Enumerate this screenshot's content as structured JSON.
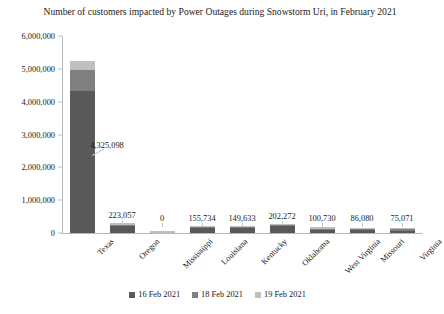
{
  "chart_data": {
    "type": "bar",
    "subtype": "stacked-column",
    "title": "Number of customers impacted by Power Outages during Snowstorm Uri, in February 2021",
    "xlabel": "",
    "ylabel": "",
    "ylim": [
      0,
      6000000
    ],
    "ytick_labels": [
      "6,000,000",
      "5,000,000",
      "4,000,000",
      "3,000,000",
      "2,000,000",
      "1,000,000",
      "0"
    ],
    "ytick_values": [
      6000000,
      5000000,
      4000000,
      3000000,
      2000000,
      1000000,
      0
    ],
    "grid": false,
    "legend_position": "bottom",
    "categories": [
      "Texas",
      "Oregon",
      "Mississippi",
      "Louisiana",
      "Kentucky",
      "Oklahoma",
      "West Virginia",
      "Missouri",
      "Virginia"
    ],
    "series": [
      {
        "name": "16 Feb 2021",
        "color": "#595959",
        "values": [
          4325098,
          223057,
          0,
          155734,
          149633,
          202272,
          100730,
          86080,
          75071
        ]
      },
      {
        "name": "18 Feb 2021",
        "color": "#808080",
        "values": [
          650000,
          30000,
          0,
          18000,
          16000,
          22000,
          8000,
          7000,
          6000
        ]
      },
      {
        "name": "19 Feb 2021",
        "color": "#bfbfbf",
        "values": [
          250000,
          14000,
          60000,
          9000,
          8000,
          11000,
          4000,
          3500,
          3000
        ]
      }
    ],
    "data_labels": [
      "4,325,098",
      "223,057",
      "0",
      "155,734",
      "149,633",
      "202,272",
      "100,730",
      "86,080",
      "75,071"
    ],
    "colors": {
      "series_16feb": "#595959",
      "series_18feb": "#808080",
      "series_19feb": "#bfbfbf",
      "axis": "#b8b8b8",
      "text": "#1a1a1a",
      "background": "#ffffff"
    }
  },
  "legend": {
    "items": [
      {
        "label": "16 Feb 2021",
        "color": "#595959"
      },
      {
        "label": "18 Feb 2021",
        "color": "#808080"
      },
      {
        "label": "19 Feb 2021",
        "color": "#bfbfbf"
      }
    ]
  }
}
